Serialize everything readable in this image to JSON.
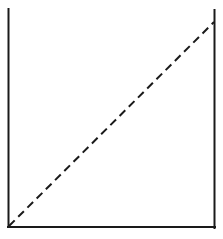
{
  "diagram": {
    "type": "container-with-diagonal",
    "width": 223,
    "height": 239,
    "background": "#ffffff",
    "stroke_color": "#1a1a1a",
    "container": {
      "left_wall": {
        "x": 8.5,
        "y1": 9,
        "y2": 227
      },
      "right_wall": {
        "x": 214.5,
        "y1": 10,
        "y2": 228
      },
      "bottom": {
        "y": 227,
        "x1": 8,
        "x2": 215
      }
    },
    "diagonal": {
      "style": "dashed",
      "x1": 9,
      "y1": 226,
      "x2": 214,
      "y2": 22,
      "dash": "8 5"
    }
  }
}
